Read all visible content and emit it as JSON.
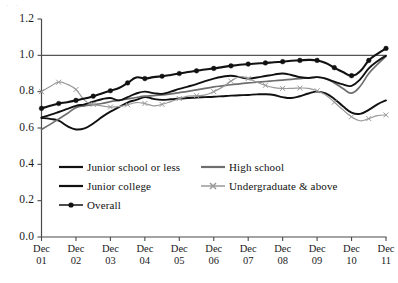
{
  "chart_data": {
    "type": "line",
    "title": "",
    "subtitle": "",
    "xlabel": "",
    "ylabel": "",
    "xlim": [
      0,
      10
    ],
    "ylim": [
      0.0,
      1.2
    ],
    "yticks": [
      "0.0",
      "0.2",
      "0.4",
      "0.6",
      "0.8",
      "1.0",
      "1.2"
    ],
    "ytick_values": [
      0.0,
      0.2,
      0.4,
      0.6,
      0.8,
      1.0,
      1.2
    ],
    "categories": [
      "Dec 01",
      "Dec 02",
      "Dec 03",
      "Dec 04",
      "Dec 05",
      "Dec 06",
      "Dec 07",
      "Dec 08",
      "Dec 09",
      "Dec 10",
      "Dec 11"
    ],
    "xtick_labels": [
      {
        "line1": "Dec",
        "line2": "01"
      },
      {
        "line1": "Dec",
        "line2": "02"
      },
      {
        "line1": "Dec",
        "line2": "03"
      },
      {
        "line1": "Dec",
        "line2": "04"
      },
      {
        "line1": "Dec",
        "line2": "05"
      },
      {
        "line1": "Dec",
        "line2": "06"
      },
      {
        "line1": "Dec",
        "line2": "07"
      },
      {
        "line1": "Dec",
        "line2": "08"
      },
      {
        "line1": "Dec",
        "line2": "09"
      },
      {
        "line1": "Dec",
        "line2": "10"
      },
      {
        "line1": "Dec",
        "line2": "11"
      }
    ],
    "grid": false,
    "reference_lines": [
      {
        "y": 1.0,
        "color": "#555555"
      }
    ],
    "legend_position": "inside-lower-left",
    "series": [
      {
        "name": "Junior school or less",
        "color": "#111111",
        "marker": "none",
        "width": 1.9,
        "x": [
          0,
          0.25,
          0.5,
          0.75,
          1,
          1.25,
          1.5,
          1.75,
          2,
          2.25,
          2.5,
          2.75,
          3,
          3.25,
          3.5,
          3.75,
          4,
          4.25,
          4.5,
          4.75,
          5,
          5.25,
          5.5,
          5.75,
          6,
          6.25,
          6.5,
          6.75,
          7,
          7.25,
          7.5,
          7.75,
          8,
          8.25,
          8.5,
          8.75,
          9,
          9.25,
          9.5,
          9.75,
          10
        ],
        "values": [
          0.655,
          0.65,
          0.64,
          0.61,
          0.592,
          0.598,
          0.625,
          0.66,
          0.69,
          0.715,
          0.74,
          0.755,
          0.77,
          0.76,
          0.755,
          0.758,
          0.762,
          0.765,
          0.768,
          0.77,
          0.772,
          0.775,
          0.778,
          0.78,
          0.782,
          0.785,
          0.786,
          0.782,
          0.77,
          0.765,
          0.775,
          0.79,
          0.8,
          0.79,
          0.76,
          0.72,
          0.685,
          0.678,
          0.7,
          0.73,
          0.752
        ]
      },
      {
        "name": "High school",
        "color": "#6e6e6e",
        "marker": "none",
        "width": 1.7,
        "x": [
          0,
          0.25,
          0.5,
          0.75,
          1,
          1.25,
          1.5,
          1.75,
          2,
          2.25,
          2.5,
          2.75,
          3,
          3.25,
          3.5,
          3.75,
          4,
          4.25,
          4.5,
          4.75,
          5,
          5.25,
          5.5,
          5.75,
          6,
          6.25,
          6.5,
          6.75,
          7,
          7.25,
          7.5,
          7.75,
          8,
          8.25,
          8.5,
          8.75,
          9,
          9.25,
          9.5,
          9.75,
          10
        ],
        "values": [
          0.592,
          0.62,
          0.65,
          0.68,
          0.712,
          0.722,
          0.728,
          0.735,
          0.745,
          0.752,
          0.76,
          0.768,
          0.775,
          0.778,
          0.782,
          0.788,
          0.795,
          0.802,
          0.81,
          0.818,
          0.826,
          0.832,
          0.838,
          0.843,
          0.848,
          0.852,
          0.856,
          0.86,
          0.864,
          0.868,
          0.872,
          0.876,
          0.88,
          0.872,
          0.848,
          0.818,
          0.792,
          0.83,
          0.9,
          0.95,
          0.995
        ]
      },
      {
        "name": "Junior college",
        "color": "#111111",
        "marker": "none",
        "width": 1.9,
        "x": [
          0,
          0.25,
          0.5,
          0.75,
          1,
          1.25,
          1.5,
          1.75,
          2,
          2.25,
          2.5,
          2.75,
          3,
          3.25,
          3.5,
          3.75,
          4,
          4.25,
          4.5,
          4.75,
          5,
          5.25,
          5.5,
          5.75,
          6,
          6.25,
          6.5,
          6.75,
          7,
          7.25,
          7.5,
          7.75,
          8,
          8.25,
          8.5,
          8.75,
          9,
          9.25,
          9.5,
          9.75,
          10
        ],
        "values": [
          0.658,
          0.672,
          0.688,
          0.705,
          0.722,
          0.73,
          0.745,
          0.758,
          0.765,
          0.752,
          0.77,
          0.79,
          0.8,
          0.792,
          0.788,
          0.8,
          0.815,
          0.828,
          0.842,
          0.858,
          0.872,
          0.882,
          0.888,
          0.88,
          0.872,
          0.878,
          0.886,
          0.894,
          0.9,
          0.892,
          0.88,
          0.875,
          0.88,
          0.872,
          0.855,
          0.84,
          0.832,
          0.868,
          0.928,
          0.968,
          0.998
        ]
      },
      {
        "name": "Undergraduate & above",
        "color": "#9a9a9a",
        "marker": "x",
        "width": 1.2,
        "x": [
          0,
          0.25,
          0.5,
          0.75,
          1,
          1.25,
          1.5,
          1.75,
          2,
          2.25,
          2.5,
          2.75,
          3,
          3.25,
          3.5,
          3.75,
          4,
          4.25,
          4.5,
          4.75,
          5,
          5.25,
          5.5,
          5.75,
          6,
          6.25,
          6.5,
          6.75,
          7,
          7.25,
          7.5,
          7.75,
          8,
          8.25,
          8.5,
          8.75,
          9,
          9.25,
          9.5,
          9.75,
          10
        ],
        "values": [
          0.8,
          0.828,
          0.852,
          0.84,
          0.812,
          0.752,
          0.73,
          0.722,
          0.715,
          0.718,
          0.728,
          0.74,
          0.735,
          0.722,
          0.73,
          0.745,
          0.762,
          0.775,
          0.778,
          0.782,
          0.8,
          0.825,
          0.858,
          0.882,
          0.872,
          0.852,
          0.835,
          0.822,
          0.818,
          0.818,
          0.82,
          0.818,
          0.805,
          0.782,
          0.742,
          0.7,
          0.662,
          0.64,
          0.652,
          0.668,
          0.672
        ]
      },
      {
        "name": "Overall",
        "color": "#111111",
        "marker": "filled-diamond",
        "width": 2.1,
        "x": [
          0,
          0.25,
          0.5,
          0.75,
          1,
          1.25,
          1.5,
          1.75,
          2,
          2.25,
          2.5,
          2.75,
          3,
          3.25,
          3.5,
          3.75,
          4,
          4.25,
          4.5,
          4.75,
          5,
          5.25,
          5.5,
          5.75,
          6,
          6.25,
          6.5,
          6.75,
          7,
          7.25,
          7.5,
          7.75,
          8,
          8.25,
          8.5,
          8.75,
          9,
          9.25,
          9.5,
          9.75,
          10
        ],
        "values": [
          0.708,
          0.722,
          0.735,
          0.742,
          0.752,
          0.762,
          0.775,
          0.79,
          0.805,
          0.82,
          0.848,
          0.878,
          0.872,
          0.88,
          0.885,
          0.892,
          0.9,
          0.908,
          0.915,
          0.922,
          0.928,
          0.935,
          0.942,
          0.948,
          0.952,
          0.955,
          0.958,
          0.962,
          0.965,
          0.97,
          0.972,
          0.975,
          0.972,
          0.958,
          0.932,
          0.908,
          0.888,
          0.912,
          0.972,
          1.008,
          1.038
        ]
      }
    ],
    "series_markers_visible": [
      "Overall",
      "Undergraduate & above"
    ]
  },
  "axis": {
    "y_labels": [
      "1.2",
      "1.0",
      "0.8",
      "0.6",
      "0.4",
      "0.2",
      "0.0"
    ],
    "axis_color": "#4a4a4a"
  },
  "legend": {
    "entries": [
      {
        "label": "Junior school or less",
        "style": "line",
        "color": "#111111",
        "marker": "none"
      },
      {
        "label": "High school",
        "style": "line",
        "color": "#6e6e6e",
        "marker": "none"
      },
      {
        "label": "Junior college",
        "style": "line",
        "color": "#111111",
        "marker": "none"
      },
      {
        "label": "Undergraduate & above",
        "style": "line-marker",
        "color": "#9a9a9a",
        "marker": "x"
      },
      {
        "label": "Overall",
        "style": "line-marker",
        "color": "#111111",
        "marker": "filled-diamond"
      }
    ]
  },
  "artifact": {
    "top_text": "· ·"
  }
}
